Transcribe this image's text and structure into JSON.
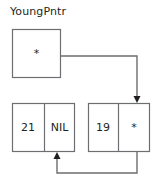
{
  "diagram": {
    "type": "linked-list",
    "title": "YoungPntr",
    "stroke_color": "#6d6e71",
    "text_color": "#231f20",
    "background": "#ffffff",
    "pointer_glyph": "*",
    "null_label": "NIL",
    "head_cell": {
      "name": "head-pointer-box",
      "value": "*",
      "x": 12,
      "y": 29,
      "width": 49,
      "height": 49
    },
    "nodes": [
      {
        "name": "node-21",
        "data": "21",
        "next": "NIL",
        "x": 12,
        "y": 103,
        "width": 63,
        "height": 49,
        "divider_x": 44
      },
      {
        "name": "node-19",
        "data": "19",
        "next": "*",
        "x": 88,
        "y": 103,
        "width": 62,
        "height": 49,
        "divider_x": 118
      }
    ],
    "edges": [
      {
        "name": "head-to-node-19",
        "from": "head-pointer-box",
        "to": "node-19",
        "path": "M 61 56 L 137 56 L 137 99",
        "arrow": "down"
      },
      {
        "name": "node-19-to-node-21",
        "from": "node-19",
        "to": "node-21",
        "path": "M 137 152 L 137 173 L 57 173 L 57 156",
        "arrow": "up"
      }
    ]
  }
}
